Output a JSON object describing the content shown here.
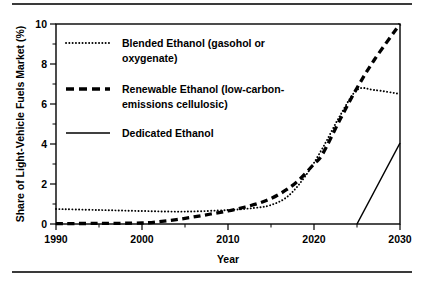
{
  "figure": {
    "top_rule": "horizontal-rule",
    "bottom_rule": "horizontal-rule"
  },
  "chart_data": {
    "type": "line",
    "title": "",
    "xlabel": "Year",
    "ylabel": "Share of Light-Vehicle Fuels Market (%)",
    "xlim": [
      1990,
      2030
    ],
    "ylim": [
      0,
      10
    ],
    "xticks": [
      1990,
      2000,
      2010,
      2020,
      2030
    ],
    "xticks_minor": [
      1995,
      2005,
      2015,
      2025
    ],
    "yticks": [
      0,
      2,
      4,
      6,
      8,
      10
    ],
    "yticks_minor": [
      1,
      3,
      5,
      7,
      9
    ],
    "grid": false,
    "legend_position": "upper-left-inside",
    "series": [
      {
        "name": "Blended Ethanol (gasohol or oxygenate)",
        "legend_line1": "Blended Ethanol (gasohol or",
        "legend_line2": "oxygenate)",
        "style": "dotted",
        "x": [
          1990,
          1995,
          2000,
          2005,
          2010,
          2013,
          2015,
          2017,
          2019,
          2021,
          2023,
          2025,
          2027,
          2030
        ],
        "y": [
          0.75,
          0.7,
          0.65,
          0.62,
          0.7,
          0.8,
          0.95,
          1.4,
          2.4,
          3.8,
          5.4,
          6.7,
          6.7,
          6.5
        ]
      },
      {
        "name": "Renewable Ethanol (low-carbon-emissions cellulosic)",
        "legend_line1": "Renewable Ethanol (low-carbon-",
        "legend_line2": "emissions cellulosic)",
        "style": "dashed",
        "x": [
          1990,
          1995,
          2000,
          2002,
          2004,
          2006,
          2008,
          2010,
          2012,
          2014,
          2016,
          2018,
          2020,
          2021,
          2023,
          2025,
          2027,
          2030
        ],
        "y": [
          0.02,
          0.03,
          0.05,
          0.12,
          0.22,
          0.35,
          0.5,
          0.65,
          0.85,
          1.1,
          1.5,
          2.1,
          3.0,
          3.5,
          5.2,
          6.8,
          8.2,
          10.0
        ]
      },
      {
        "name": "Dedicated Ethanol",
        "legend_line1": "Dedicated Ethanol",
        "legend_line2": "",
        "style": "solid",
        "x": [
          2025,
          2030
        ],
        "y": [
          0.0,
          4.05
        ]
      }
    ]
  }
}
